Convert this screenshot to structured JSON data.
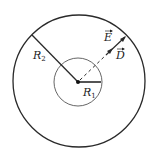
{
  "diagram": {
    "title": "",
    "colors": {
      "stroke": "#2a2a2a",
      "inner_stroke": "#555555",
      "background": "#ffffff"
    },
    "geometry": {
      "center": [
        78,
        82
      ],
      "outer_radius": 66,
      "inner_radius": 24
    },
    "labels": {
      "r2": {
        "base": "R",
        "sub": "2"
      },
      "r1": {
        "base": "R",
        "sub": "1"
      },
      "e_field": {
        "base": "E",
        "vector": true
      },
      "d_field": {
        "base": "D",
        "vector": true
      }
    },
    "elements": [
      "outer-circle (radius R2)",
      "inner-circle (radius R1)",
      "radius-line R2 (solid, upper-left)",
      "radius-line R1 (solid, horizontal right)",
      "dashed radial line with arrows (upper-right) labeled E and D",
      "center dot"
    ]
  }
}
